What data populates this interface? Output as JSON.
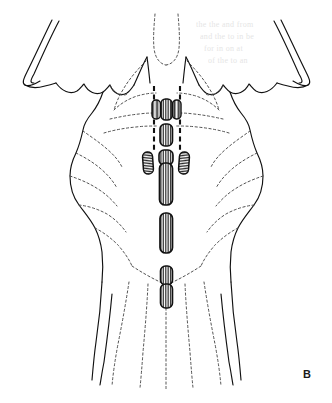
{
  "figure": {
    "panel_label": "B",
    "background_color": "#ffffff",
    "ink_color": "#111111",
    "dashed_guide_color": "#3a3a3a",
    "faint_outline_color": "#555555",
    "hatch_color": "#1a1a1a",
    "label_color": "#1a1a1a"
  },
  "regions": [
    {
      "name": "cerebellar-peduncle-left",
      "description": "cut stump of left cerebellar peduncle, upper left"
    },
    {
      "name": "cerebellar-peduncle-right",
      "description": "cut stump of right cerebellar peduncle, upper right"
    },
    {
      "name": "cerebellum-cut-surface-left",
      "description": "scalloped cut margin of left cerebellar hemisphere"
    },
    {
      "name": "cerebellum-cut-surface-right",
      "description": "scalloped cut margin of right cerebellar hemisphere"
    },
    {
      "name": "floor-of-fourth-ventricle",
      "description": "rhomboid fossa outlined in dashed line"
    },
    {
      "name": "medulla-oblongata",
      "description": "lower tapering body of the brainstem"
    },
    {
      "name": "spinal-cord-transition",
      "description": "caudal flare toward the spinal cord"
    }
  ],
  "markers": {
    "description": "Hatched elongated rectangular markers arrayed along and beside the midline",
    "midline_markers": [
      {
        "id": "marker-m1",
        "order": 1,
        "position": "rostral midline"
      },
      {
        "id": "marker-m2",
        "order": 2,
        "position": "upper midline"
      },
      {
        "id": "marker-m3",
        "order": 3,
        "position": "mid-upper midline"
      },
      {
        "id": "marker-m4",
        "order": 4,
        "position": "mid midline, long"
      },
      {
        "id": "marker-m5",
        "order": 5,
        "position": "mid-caudal midline, long"
      },
      {
        "id": "marker-m6",
        "order": 6,
        "position": "caudal midline upper"
      },
      {
        "id": "marker-m7",
        "order": 7,
        "position": "caudal midline lower"
      }
    ],
    "lateral_markers": [
      {
        "id": "marker-left-lateral",
        "side": "left",
        "position": "lateral to midline, mid level"
      },
      {
        "id": "marker-right-lateral",
        "side": "right",
        "position": "lateral to midline, mid level"
      }
    ],
    "paramedian_markers": [
      {
        "id": "marker-paramedian-left",
        "side": "left",
        "position": "flanking the rostral midline group"
      },
      {
        "id": "marker-paramedian-right",
        "side": "right",
        "position": "flanking the rostral midline group"
      }
    ]
  },
  "guides": {
    "dashed_vertical_left": "heavy dashed vertical guide line, left of midline",
    "dashed_vertical_right": "heavy dashed vertical guide line, right of midline"
  },
  "bleed_through_text": [
    "the the and from",
    "and the to in be",
    "for in on at",
    "of the to an"
  ]
}
